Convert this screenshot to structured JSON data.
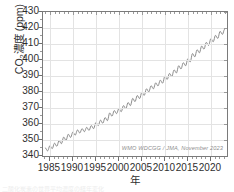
{
  "figure": {
    "ylabel_pre": "CO",
    "ylabel_sub": "2",
    "ylabel_post": "濃度 (ppm)",
    "xlabel": "年",
    "attribution": "WMO WDCGG / JMA, November 2023",
    "caption_clipped": "二酸化炭素の世界平均濃度の経年変化",
    "series_color": "#808080",
    "frame_color": "#7a7a7a",
    "grid_color": "#e3e3e3",
    "background": "#ffffff"
  },
  "chart_data": {
    "type": "line",
    "title": "",
    "subtitle": "",
    "xlabel": "年",
    "ylabel": "CO2濃度 (ppm)",
    "xlim": [
      1983.5,
      2023.5
    ],
    "ylim": [
      340,
      430
    ],
    "yticks": [
      340,
      350,
      360,
      370,
      380,
      390,
      400,
      410,
      420,
      430
    ],
    "xticks": [
      1985,
      1990,
      1995,
      2000,
      2005,
      2010,
      2015,
      2020
    ],
    "ytick_minor_step": 5,
    "xtick_minor_step": 1,
    "grid": true,
    "legend": "none",
    "annotations": [
      {
        "text": "WMO WDCGG / JMA, November 2023",
        "position": "bottom-right-inside"
      }
    ],
    "series": [
      {
        "name": "Global mean CO2 (monthly)",
        "color": "#808080",
        "seasonal_amplitude_ppm": 3.0,
        "x": [
          1984.0,
          1984.5,
          1985.0,
          1985.5,
          1986.0,
          1986.5,
          1987.0,
          1987.5,
          1988.0,
          1988.5,
          1989.0,
          1989.5,
          1990.0,
          1990.5,
          1991.0,
          1991.5,
          1992.0,
          1992.5,
          1993.0,
          1993.5,
          1994.0,
          1994.5,
          1995.0,
          1995.5,
          1996.0,
          1996.5,
          1997.0,
          1997.5,
          1998.0,
          1998.5,
          1999.0,
          1999.5,
          2000.0,
          2000.5,
          2001.0,
          2001.5,
          2002.0,
          2002.5,
          2003.0,
          2003.5,
          2004.0,
          2004.5,
          2005.0,
          2005.5,
          2006.0,
          2006.5,
          2007.0,
          2007.5,
          2008.0,
          2008.5,
          2009.0,
          2009.5,
          2010.0,
          2010.5,
          2011.0,
          2011.5,
          2012.0,
          2012.5,
          2013.0,
          2013.5,
          2014.0,
          2014.5,
          2015.0,
          2015.5,
          2016.0,
          2016.5,
          2017.0,
          2017.5,
          2018.0,
          2018.5,
          2019.0,
          2019.5,
          2020.0,
          2020.5,
          2021.0,
          2021.5,
          2022.0,
          2022.5,
          2023.0
        ],
        "values": [
          345.0,
          343.2,
          346.4,
          344.6,
          348.0,
          346.1,
          349.6,
          347.7,
          351.8,
          349.8,
          353.6,
          351.6,
          355.0,
          353.0,
          356.3,
          354.4,
          357.1,
          355.2,
          357.9,
          356.0,
          359.0,
          357.1,
          360.9,
          359.0,
          362.4,
          360.5,
          364.0,
          362.1,
          366.9,
          364.9,
          368.4,
          366.5,
          369.6,
          367.7,
          371.5,
          369.6,
          373.4,
          371.5,
          376.0,
          374.0,
          377.8,
          375.9,
          379.8,
          377.9,
          382.0,
          380.1,
          383.9,
          382.0,
          385.7,
          383.8,
          387.4,
          385.5,
          389.9,
          387.9,
          391.6,
          389.7,
          393.8,
          391.9,
          396.4,
          394.4,
          398.3,
          396.4,
          400.8,
          398.8,
          404.0,
          402.0,
          406.4,
          404.5,
          408.7,
          406.8,
          411.0,
          409.1,
          413.3,
          411.4,
          415.4,
          413.5,
          417.9,
          416.0,
          419.3
        ],
        "annual_mean_first": 344.1,
        "annual_mean_last": 417.9
      }
    ],
    "trend_description": "Monthly global mean CO2 rising from ~344 ppm (1984) to ~419 ppm (2023) with ~3 ppm seasonal oscillation"
  }
}
